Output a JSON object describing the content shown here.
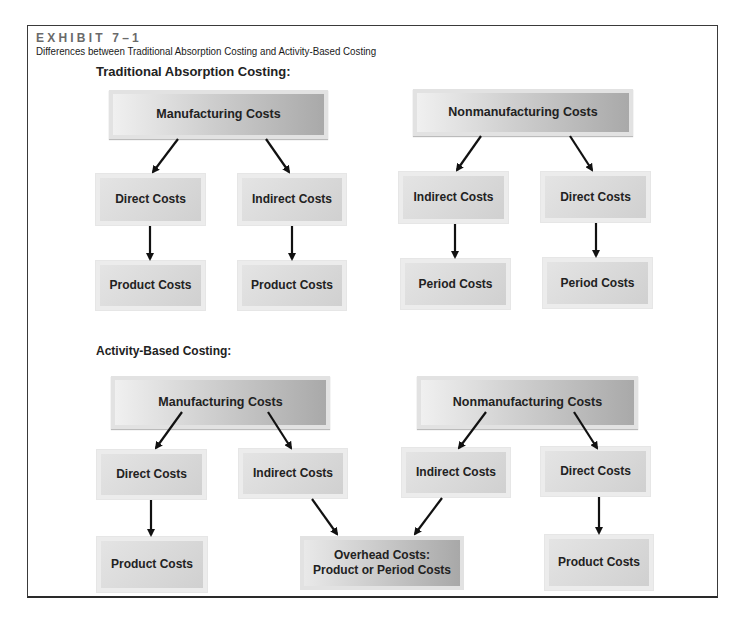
{
  "header": {
    "exhibit_label": "EXHIBIT 7–1",
    "subtitle": "Differences between Traditional Absorption Costing and Activity-Based Costing"
  },
  "traditional": {
    "title": "Traditional Absorption Costing:",
    "manufacturing": {
      "label": "Manufacturing Costs",
      "direct": "Direct Costs",
      "indirect": "Indirect Costs",
      "direct_result": "Product Costs",
      "indirect_result": "Product Costs"
    },
    "nonmanufacturing": {
      "label": "Nonmanufacturing Costs",
      "indirect": "Indirect Costs",
      "direct": "Direct Costs",
      "indirect_result": "Period Costs",
      "direct_result": "Period Costs"
    }
  },
  "abc": {
    "title": "Activity-Based Costing:",
    "manufacturing": {
      "label": "Manufacturing Costs",
      "direct": "Direct Costs",
      "indirect": "Indirect Costs",
      "direct_result": "Product Costs"
    },
    "nonmanufacturing": {
      "label": "Nonmanufacturing Costs",
      "indirect": "Indirect Costs",
      "direct": "Direct Costs",
      "direct_result": "Product Costs"
    },
    "overhead": {
      "line1": "Overhead Costs:",
      "line2": "Product or Period Costs"
    }
  },
  "colors": {
    "arrow": "#111111",
    "frame": "#3a3a3a",
    "exhibit_label": "#6a6a6a"
  }
}
